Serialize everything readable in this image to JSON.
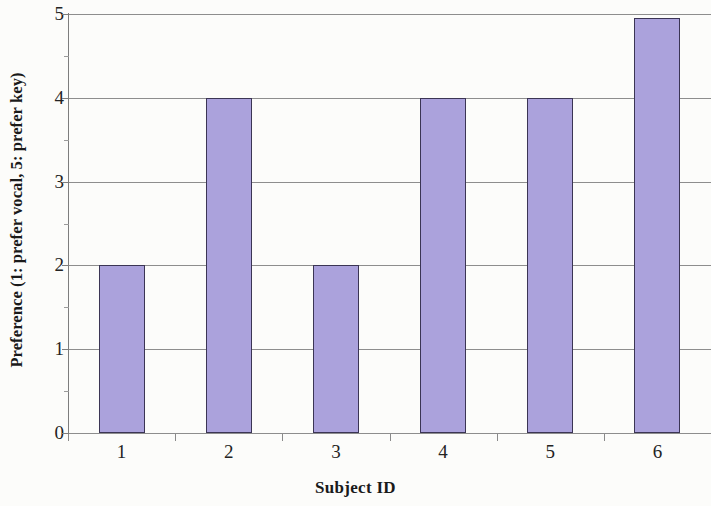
{
  "chart_data": {
    "type": "bar",
    "title": "",
    "xlabel": "Subject ID",
    "ylabel": "Preference (1: prefer vocal, 5: prefer key)",
    "categories": [
      "1",
      "2",
      "3",
      "4",
      "5",
      "6"
    ],
    "values": [
      2,
      4,
      2,
      4,
      4,
      4.95
    ],
    "ylim": [
      0,
      5
    ],
    "yticks": [
      "0",
      "1",
      "2",
      "3",
      "4",
      "5"
    ],
    "grid": "horizontal",
    "legend": "none",
    "series": [
      {
        "name": "Preference",
        "values": [
          2,
          4,
          2,
          4,
          4,
          4.95
        ]
      }
    ],
    "colors": {
      "bar_fill": "#aba2dc",
      "bar_edge": "#3b3554",
      "gridline": "#8d8d8d",
      "axis": "#7d7d7d",
      "text": "#232323",
      "background": "#fcfcfa"
    }
  }
}
